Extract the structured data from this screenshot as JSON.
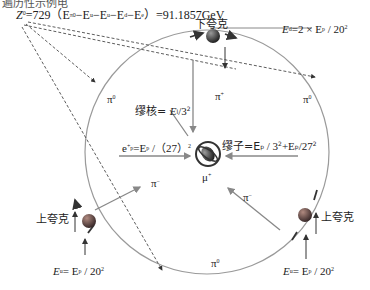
{
  "title_cutoff": "遍历性示例电",
  "z0_formula": {
    "prefix": "Z",
    "sup": "0",
    "body": "=729（E",
    "sub_pi0": "π0",
    "m1": "−E",
    "sub_u1": "u",
    "m2": "−E",
    "sub_u2": "u",
    "m3": "−E",
    "sub_d": "d",
    "m4": "−E",
    "sub_e": "e",
    "tail": "）=91.1857GeV"
  },
  "labels": {
    "down_quark": "下夸克",
    "up_quark_left": "上夸克",
    "up_quark_right": "上夸克",
    "pi0_left": "π",
    "pi0_right": "π",
    "pi0_bottom": "π",
    "pi_plus": "π",
    "pi_minus_left": "π",
    "pi_minus_right": "π",
    "mu_plus": "μ",
    "sup_zero": "0",
    "sup_plus": "+",
    "sup_minus": "−"
  },
  "formulas": {
    "ed": {
      "E": "E",
      "sub": "d",
      "rest": "=2 × E",
      "sub2": "p",
      "tail": " / 20",
      "sup": "2"
    },
    "muon_core": {
      "name": "缪核= ",
      "E": "E",
      "sub": "l",
      "tail": "/3",
      "sup": "2"
    },
    "ep": {
      "e": "e",
      "sup": "+",
      "sub": "p",
      "rest": "=E",
      "sub2": "p",
      "tail": " /（27）",
      "sup2": "2"
    },
    "muon": {
      "name": "缪子=E",
      "sub": "p",
      "mid": " / 3",
      "sup": "2",
      "plus": "+E",
      "sub2": "p",
      "tail": "/27",
      "sup2": "2"
    },
    "eu_left": {
      "E": "E",
      "sub": "u",
      "rest": "= E",
      "sub2": "p",
      "tail": " / 20",
      "sup": "2"
    },
    "eu_right": {
      "E": "E",
      "sub": "u",
      "rest": "= E",
      "sub2": "p",
      "tail": " / 20",
      "sup": "2"
    }
  },
  "colors": {
    "circle": "#9a9a9a",
    "arrow_gray": "#8a8a8a",
    "dashed": "#333333",
    "quark_dark": "#3a3a3a",
    "quark_red": "#6b4a4a"
  }
}
